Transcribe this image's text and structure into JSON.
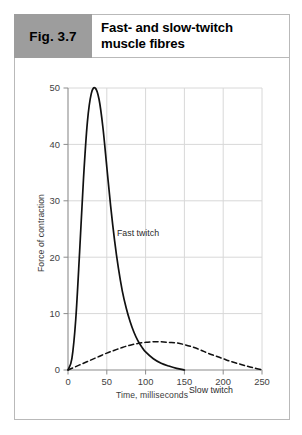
{
  "figure": {
    "tag": "Fig. 3.7",
    "title": "Fast- and slow-twitch\nmuscle fibres"
  },
  "colors": {
    "tag_background": "#9d9d9d",
    "frame_border": "#b9b9b9",
    "gridline": "#d8d8d8",
    "axis": "#8c8c8c",
    "curve": "#111111",
    "text": "#2a2a2a"
  },
  "chart_data": {
    "type": "line",
    "title": "Fast- and slow-twitch muscle fibres",
    "xlabel": "Time, milliseconds",
    "ylabel": "Force of contraction",
    "xlim": [
      0,
      250
    ],
    "ylim": [
      0,
      50
    ],
    "xticks": [
      "0",
      "50",
      "100",
      "150",
      "200",
      "250"
    ],
    "yticks": [
      "0",
      "10",
      "20",
      "30",
      "40",
      "50"
    ],
    "grid": true,
    "legend": "inline-annotations",
    "series": [
      {
        "name": "Fast twitch",
        "style": "solid",
        "annotation": "Fast twitch",
        "x": [
          0,
          5,
          10,
          15,
          20,
          25,
          30,
          35,
          40,
          45,
          50,
          55,
          60,
          65,
          70,
          75,
          80,
          85,
          90,
          95,
          100,
          110,
          120,
          130,
          140,
          150
        ],
        "y": [
          0,
          2,
          9,
          21,
          34,
          44,
          49,
          50,
          48,
          43,
          36,
          29,
          23,
          18,
          14,
          11,
          8.6,
          6.7,
          5.2,
          4.1,
          3.2,
          2.0,
          1.2,
          0.7,
          0.3,
          0
        ]
      },
      {
        "name": "Slow twitch",
        "style": "dashed",
        "annotation": "Slow twitch",
        "x": [
          0,
          10,
          20,
          30,
          40,
          50,
          60,
          70,
          80,
          90,
          100,
          110,
          120,
          130,
          140,
          150,
          160,
          170,
          180,
          190,
          200,
          210,
          220,
          230,
          240,
          250
        ],
        "y": [
          0,
          0.6,
          1.2,
          1.8,
          2.4,
          3.0,
          3.5,
          4.0,
          4.4,
          4.7,
          4.9,
          5.0,
          5.0,
          4.9,
          4.8,
          4.5,
          4.1,
          3.6,
          3.0,
          2.5,
          2.0,
          1.5,
          1.1,
          0.7,
          0.35,
          0.05
        ]
      }
    ]
  }
}
